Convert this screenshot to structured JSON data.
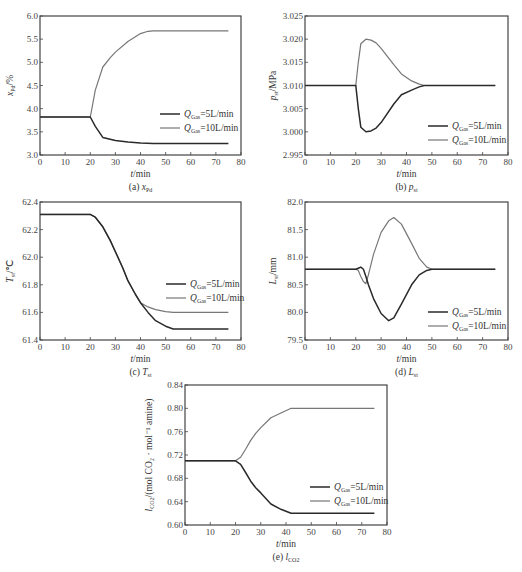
{
  "figure": {
    "legend": {
      "series1": {
        "prefix": "Q",
        "sub": "Gas",
        "suffix": "=5L/min"
      },
      "series2": {
        "prefix": "Q",
        "sub": "Gas",
        "suffix": "=10L/min"
      }
    },
    "xlabel_italic": "t",
    "xlabel_unit": "/min",
    "colors": {
      "series_5": "#2a2a2a",
      "series_10": "#777777",
      "axis": "#444444"
    }
  },
  "chart_data": [
    {
      "id": "a",
      "type": "line",
      "caption_prefix": "(a) ",
      "caption_var": "x",
      "caption_sub": "Pd",
      "ylabel_var": "x",
      "ylabel_sub": "Pd",
      "ylabel_unit": "/%",
      "xlabel": "t/min",
      "xlim": [
        0,
        80
      ],
      "ylim": [
        3.0,
        6.0
      ],
      "xticks": [
        "0",
        "10",
        "20",
        "30",
        "40",
        "50",
        "60",
        "70",
        "80"
      ],
      "yticks": [
        "3.0",
        "3.5",
        "4.0",
        "4.5",
        "5.0",
        "5.5",
        "6.0"
      ],
      "legend_position": "lower right",
      "series": [
        {
          "name": "Q_Gas=5L/min",
          "x": [
            0,
            20,
            22,
            25,
            30,
            35,
            40,
            45,
            50,
            60,
            75
          ],
          "y": [
            3.82,
            3.82,
            3.62,
            3.38,
            3.31,
            3.28,
            3.26,
            3.25,
            3.25,
            3.25,
            3.25
          ]
        },
        {
          "name": "Q_Gas=10L/min",
          "x": [
            0,
            20,
            22,
            25,
            28,
            30,
            35,
            40,
            43,
            45,
            50,
            60,
            75
          ],
          "y": [
            3.82,
            3.82,
            4.4,
            4.9,
            5.1,
            5.22,
            5.45,
            5.62,
            5.67,
            5.68,
            5.68,
            5.68,
            5.68
          ]
        }
      ]
    },
    {
      "id": "b",
      "type": "line",
      "caption_prefix": "(b) ",
      "caption_var": "p",
      "caption_sub": "st",
      "ylabel_var": "p",
      "ylabel_sub": "st",
      "ylabel_unit": "/MPa",
      "xlabel": "t/min",
      "xlim": [
        0,
        80
      ],
      "ylim": [
        2.995,
        3.025
      ],
      "xticks": [
        "0",
        "10",
        "20",
        "30",
        "40",
        "50",
        "60",
        "70",
        "80"
      ],
      "yticks": [
        "2.995",
        "3.000",
        "3.005",
        "3.010",
        "3.015",
        "3.020",
        "3.025"
      ],
      "legend_position": "lower right",
      "series": [
        {
          "name": "Q_Gas=5L/min",
          "x": [
            0,
            20,
            21,
            22,
            24,
            26,
            28,
            30,
            35,
            38,
            42,
            45,
            47,
            50,
            75
          ],
          "y": [
            3.01,
            3.01,
            3.005,
            3.001,
            3.0,
            3.0002,
            3.0008,
            3.002,
            3.006,
            3.008,
            3.009,
            3.0097,
            3.01,
            3.01,
            3.01
          ]
        },
        {
          "name": "Q_Gas=10L/min",
          "x": [
            0,
            20,
            21,
            22,
            24,
            26,
            28,
            30,
            35,
            38,
            42,
            45,
            47,
            50,
            75
          ],
          "y": [
            3.01,
            3.01,
            3.015,
            3.019,
            3.02,
            3.0198,
            3.0192,
            3.018,
            3.0145,
            3.0125,
            3.011,
            3.0103,
            3.01,
            3.01,
            3.01
          ]
        }
      ]
    },
    {
      "id": "c",
      "type": "line",
      "caption_prefix": "(c) ",
      "caption_var": "T",
      "caption_sub": "st",
      "ylabel_var": "T",
      "ylabel_sub": "st",
      "ylabel_unit": "/℃",
      "xlabel": "t/min",
      "xlim": [
        0,
        80
      ],
      "ylim": [
        61.4,
        62.4
      ],
      "xticks": [
        "0",
        "10",
        "20",
        "30",
        "40",
        "50",
        "60",
        "70",
        "80"
      ],
      "yticks": [
        "61.4",
        "61.6",
        "61.8",
        "62.0",
        "62.2",
        "62.4"
      ],
      "legend_position": "center right",
      "series": [
        {
          "name": "Q_Gas=5L/min",
          "x": [
            0,
            20,
            22,
            25,
            28,
            30,
            33,
            35,
            38,
            40,
            43,
            46,
            50,
            53,
            60,
            75
          ],
          "y": [
            62.31,
            62.31,
            62.29,
            62.22,
            62.12,
            62.04,
            61.92,
            61.83,
            61.73,
            61.67,
            61.6,
            61.54,
            61.5,
            61.48,
            61.48,
            61.48
          ]
        },
        {
          "name": "Q_Gas=10L/min",
          "x": [
            0,
            20,
            22,
            25,
            28,
            30,
            33,
            35,
            38,
            40,
            43,
            46,
            50,
            53,
            60,
            75
          ],
          "y": [
            62.31,
            62.31,
            62.29,
            62.22,
            62.12,
            62.04,
            61.92,
            61.83,
            61.73,
            61.67,
            61.64,
            61.62,
            61.605,
            61.6,
            61.6,
            61.6
          ]
        }
      ]
    },
    {
      "id": "d",
      "type": "line",
      "caption_prefix": "(d) ",
      "caption_var": "L",
      "caption_sub": "st",
      "ylabel_var": "L",
      "ylabel_sub": "st",
      "ylabel_unit": "/mm",
      "xlabel": "t/min",
      "xlim": [
        0,
        80
      ],
      "ylim": [
        79.5,
        82.0
      ],
      "xticks": [
        "0",
        "10",
        "20",
        "30",
        "40",
        "50",
        "60",
        "70",
        "80"
      ],
      "yticks": [
        "79.5",
        "80.0",
        "80.5",
        "81.0",
        "81.5",
        "82.0"
      ],
      "legend_position": "lower right",
      "series": [
        {
          "name": "Q_Gas=5L/min",
          "x": [
            0,
            20,
            21,
            22,
            23,
            24,
            25,
            27,
            30,
            33,
            35,
            38,
            42,
            45,
            48,
            50,
            75
          ],
          "y": [
            80.78,
            80.78,
            80.8,
            80.82,
            80.78,
            80.65,
            80.5,
            80.25,
            79.98,
            79.85,
            79.9,
            80.15,
            80.5,
            80.68,
            80.76,
            80.78,
            80.78
          ]
        },
        {
          "name": "Q_Gas=10L/min",
          "x": [
            0,
            20,
            21,
            22,
            23,
            24,
            25,
            27,
            30,
            33,
            35,
            38,
            42,
            45,
            48,
            50,
            75
          ],
          "y": [
            80.78,
            80.78,
            80.76,
            80.65,
            80.56,
            80.52,
            80.68,
            81.05,
            81.45,
            81.66,
            81.72,
            81.6,
            81.25,
            80.98,
            80.82,
            80.78,
            80.78
          ]
        }
      ]
    },
    {
      "id": "e",
      "type": "line",
      "caption_prefix": "(e) ",
      "caption_var": "l",
      "caption_sub": "CO2",
      "ylabel_var": "l",
      "ylabel_sub": "CO2",
      "ylabel_unit": "/(mol CO₂ · mol⁻¹ amine)",
      "xlabel": "t/min",
      "xlim": [
        0,
        80
      ],
      "ylim": [
        0.6,
        0.84
      ],
      "xticks": [
        "0",
        "10",
        "20",
        "30",
        "40",
        "50",
        "60",
        "70",
        "80"
      ],
      "yticks": [
        "0.60",
        "0.64",
        "0.68",
        "0.72",
        "0.76",
        "0.80",
        "0.84"
      ],
      "legend_position": "lower right",
      "series": [
        {
          "name": "Q_Gas=5L/min",
          "x": [
            0,
            20,
            22,
            24,
            26,
            28,
            30,
            34,
            38,
            42,
            50,
            75
          ],
          "y": [
            0.71,
            0.71,
            0.704,
            0.69,
            0.675,
            0.664,
            0.655,
            0.636,
            0.627,
            0.62,
            0.62,
            0.62
          ]
        },
        {
          "name": "Q_Gas=10L/min",
          "x": [
            0,
            20,
            22,
            24,
            26,
            28,
            30,
            34,
            38,
            42,
            50,
            75
          ],
          "y": [
            0.71,
            0.71,
            0.716,
            0.73,
            0.745,
            0.757,
            0.767,
            0.784,
            0.792,
            0.8,
            0.8,
            0.8
          ]
        }
      ]
    }
  ]
}
